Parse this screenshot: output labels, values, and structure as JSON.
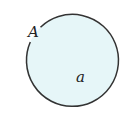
{
  "diagram": {
    "shape": "circle",
    "fill_color": "#e6f6f8",
    "stroke_color": "#333333",
    "point_label": "A",
    "region_label": "a"
  }
}
